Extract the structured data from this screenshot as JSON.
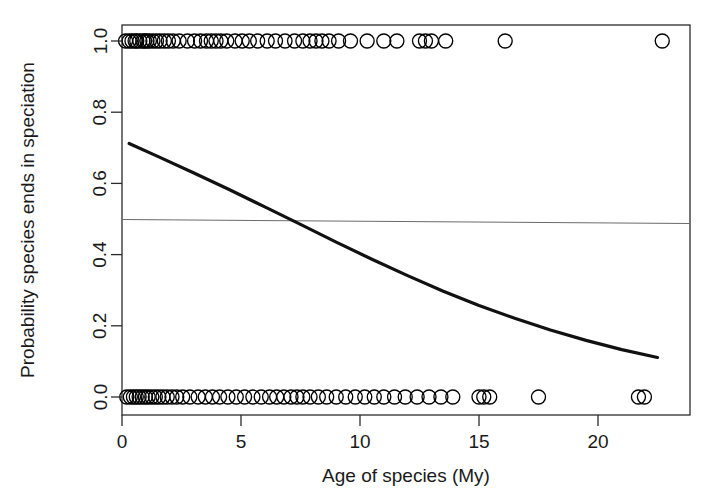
{
  "chart_data": {
    "type": "scatter",
    "title": "",
    "subtitle": "",
    "xlabel": "Age of species (My)",
    "ylabel": "Probability species ends in speciation",
    "xlim": [
      -0.6,
      23.9
    ],
    "ylim": [
      -0.045,
      1.045
    ],
    "xticks": [
      0,
      5,
      10,
      15,
      20
    ],
    "xtick_labels": [
      "0",
      "5",
      "10",
      "15",
      "20"
    ],
    "yticks": [
      0.0,
      0.2,
      0.4,
      0.6,
      0.8,
      1.0
    ],
    "ytick_labels": [
      "0.0",
      "0.2",
      "0.4",
      "0.6",
      "0.8",
      "1.0"
    ],
    "grid": false,
    "legend": null,
    "legend_position": "none",
    "frame": true,
    "marker": "open-circle",
    "marker_color": "#000000",
    "marker_size": 14,
    "series": [
      {
        "name": "Species ending in speciation (outcome = 1)",
        "type": "scatter",
        "y_value": 1.0,
        "x": [
          0.15,
          0.3,
          0.42,
          0.55,
          0.62,
          0.75,
          0.88,
          0.95,
          1.05,
          1.15,
          1.3,
          1.45,
          1.6,
          1.78,
          1.95,
          2.15,
          2.4,
          2.75,
          3.05,
          3.3,
          3.55,
          3.75,
          3.95,
          4.15,
          4.4,
          4.75,
          5.05,
          5.35,
          5.7,
          6.1,
          6.45,
          6.85,
          7.25,
          7.6,
          7.9,
          8.15,
          8.4,
          8.7,
          9.1,
          9.6,
          10.3,
          11.0,
          11.55,
          12.5,
          12.75,
          13.0,
          13.6,
          16.1,
          22.7
        ]
      },
      {
        "name": "Species not ending in speciation (outcome = 0)",
        "type": "scatter",
        "y_value": 0.0,
        "x": [
          0.2,
          0.35,
          0.48,
          0.6,
          0.72,
          0.85,
          0.98,
          1.1,
          1.25,
          1.4,
          1.55,
          1.72,
          1.9,
          2.1,
          2.3,
          2.55,
          2.85,
          3.2,
          3.5,
          3.8,
          4.1,
          4.45,
          4.8,
          5.15,
          5.5,
          5.85,
          6.2,
          6.5,
          6.8,
          7.1,
          7.35,
          7.6,
          7.9,
          8.25,
          8.6,
          9.0,
          9.4,
          9.8,
          10.2,
          10.6,
          11.0,
          11.45,
          11.9,
          12.4,
          12.9,
          13.4,
          13.9,
          15.0,
          15.2,
          15.45,
          17.5,
          21.7,
          21.95
        ]
      }
    ],
    "fitted_curve": {
      "name": "Logistic fit",
      "type": "line",
      "color": "#111111",
      "line_width": 3.2,
      "x": [
        0.3,
        1.5,
        3.0,
        4.5,
        6.0,
        7.5,
        9.0,
        10.5,
        12.0,
        13.5,
        15.0,
        16.5,
        18.0,
        19.5,
        21.0,
        22.5
      ],
      "y": [
        0.712,
        0.676,
        0.63,
        0.583,
        0.534,
        0.485,
        0.435,
        0.387,
        0.341,
        0.297,
        0.257,
        0.221,
        0.188,
        0.159,
        0.133,
        0.111
      ]
    },
    "reference_line": {
      "name": "Probability = 0.5 reference",
      "type": "hline",
      "y": 0.5,
      "color": "#6b6b6b",
      "line_width": 1.1
    },
    "annotations": []
  }
}
